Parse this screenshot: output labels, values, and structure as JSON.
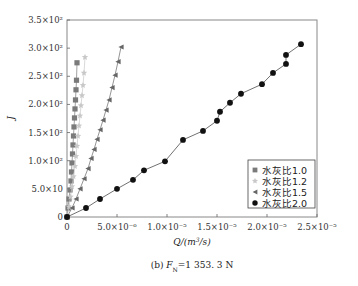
{
  "chart_data": {
    "type": "scatter",
    "title": "",
    "caption": "(b) F_N = 1 353.3 N",
    "caption_parts": {
      "prefix": "(b)",
      "var": "F",
      "sub": "N",
      "value": "=1 353. 3 N"
    },
    "xlabel": "Q/(m³/s)",
    "ylabel": "J",
    "xlim": [
      0,
      2.5e-05
    ],
    "ylim": [
      0,
      350
    ],
    "grid": false,
    "legend_position": "lower right",
    "x_ticks": [
      {
        "value": 0,
        "label": "0"
      },
      {
        "value": 5e-06,
        "label": "5.0×10⁻⁶"
      },
      {
        "value": 1e-05,
        "label": "1.0×10⁻⁵"
      },
      {
        "value": 1.5e-05,
        "label": "1.5×10⁻⁵"
      },
      {
        "value": 2e-05,
        "label": "2.0×10⁻⁵"
      },
      {
        "value": 2.5e-05,
        "label": "2.5×10⁻⁵"
      }
    ],
    "y_ticks": [
      {
        "value": 0,
        "label": "0"
      },
      {
        "value": 50,
        "label": "5.0×10"
      },
      {
        "value": 100,
        "label": "1.0×10²"
      },
      {
        "value": 150,
        "label": "1.5×10²"
      },
      {
        "value": 200,
        "label": "2.0×10²"
      },
      {
        "value": 250,
        "label": "2.5×10²"
      },
      {
        "value": 300,
        "label": "3.0×10²"
      },
      {
        "value": 350,
        "label": "3.5×10²"
      }
    ],
    "series": [
      {
        "name": "水灰比1.0",
        "marker": "square",
        "color": "#7a7a7a",
        "x": [
          0,
          1e-07,
          2e-07,
          3e-07,
          4e-07,
          4.5e-07,
          5e-07,
          5.5e-07,
          6e-07,
          6.5e-07,
          7e-07,
          7.5e-07,
          8e-07,
          8.5e-07,
          9e-07,
          9.5e-07,
          1e-06
        ],
        "y": [
          0,
          16,
          32,
          48,
          64,
          80,
          96,
          112,
          128,
          144,
          160,
          176,
          192,
          208,
          226,
          243,
          274
        ]
      },
      {
        "name": "水灰比1.2",
        "marker": "star",
        "color": "#c8c8c8",
        "x": [
          0,
          2e-07,
          3.5e-07,
          5e-07,
          6.5e-07,
          8e-07,
          9e-07,
          1e-06,
          1.1e-06,
          1.2e-06,
          1.3e-06,
          1.4e-06,
          1.5e-06,
          1.6e-06,
          1.7e-06,
          1.8e-06
        ],
        "y": [
          0,
          18,
          36,
          54,
          72,
          90,
          108,
          126,
          144,
          162,
          180,
          198,
          216,
          234,
          256,
          284
        ]
      },
      {
        "name": "水灰比1.5",
        "marker": "triangle-left",
        "color": "#666666",
        "x": [
          0,
          5e-07,
          9e-07,
          1.3e-06,
          1.7e-06,
          2.1e-06,
          2.4e-06,
          2.7e-06,
          3e-06,
          3.3e-06,
          3.6e-06,
          3.9e-06,
          4.2e-06,
          4.5e-06,
          4.8e-06,
          5.1e-06,
          5.4e-06
        ],
        "y": [
          0,
          16,
          32,
          50,
          68,
          86,
          104,
          120,
          138,
          155,
          172,
          190,
          208,
          230,
          252,
          276,
          302
        ]
      },
      {
        "name": "水灰比2.0",
        "marker": "circle",
        "color": "#111111",
        "x": [
          0,
          1.9e-06,
          3.3e-06,
          5e-06,
          6.6e-06,
          7.7e-06,
          9.8e-06,
          1.16e-05,
          1.36e-05,
          1.5e-05,
          1.53e-05,
          1.63e-05,
          1.74e-05,
          1.95e-05,
          2.06e-05,
          2.19e-05,
          2.19e-05,
          2.34e-05
        ],
        "y": [
          0,
          16,
          32,
          50,
          66,
          83,
          99,
          137,
          153,
          171,
          187,
          203,
          219,
          236,
          256,
          272,
          288,
          307
        ]
      }
    ]
  }
}
